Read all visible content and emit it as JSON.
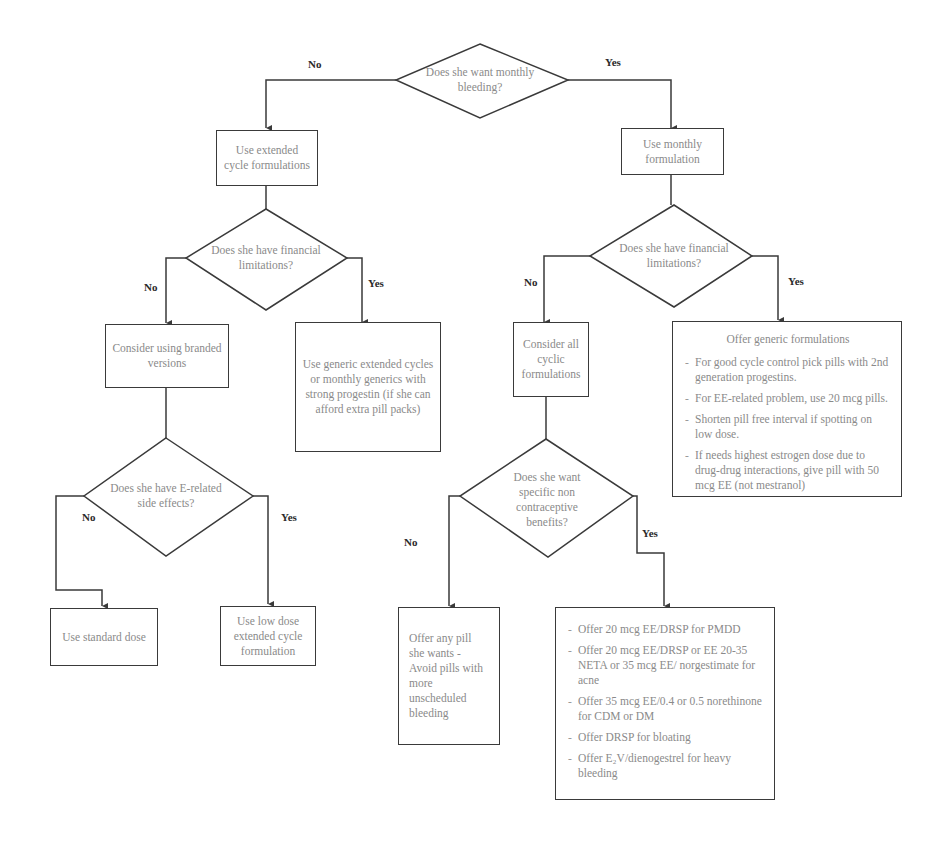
{
  "diagram": {
    "type": "flowchart",
    "colors": {
      "line": "#3a3a3a",
      "node_text": "#8a8a8a",
      "edge_label": "#2a2a2a",
      "background": "#ffffff"
    },
    "decisions": {
      "d1": "Does she want monthly bleeding?",
      "d2": "Does she have financial limitations?",
      "d3": "Does she have financial limitations?",
      "d4": "Does she have E-related side effects?",
      "d5": "Does she want specific non contraceptive benefits?"
    },
    "actions": {
      "extended": "Use extended cycle formulations",
      "monthly": "Use monthly formulation",
      "branded": "Consider using branded versions",
      "generic_extended": "Use generic extended cycles or monthly generics with strong progestin (if she can afford extra pill packs)",
      "cyclic": "Consider all cyclic formulations",
      "standard_dose": "Use standard dose",
      "low_dose": "Use low dose extended cycle formulation",
      "any_pill": "Offer any pill she wants - Avoid pills with more unscheduled bleeding"
    },
    "generic_formulations": {
      "title": "Offer generic formulations",
      "items": [
        "For good cycle control pick pills with 2nd generation progestins.",
        "For EE-related problem, use 20 mcg pills.",
        "Shorten pill free interval if spotting on low dose.",
        "If needs highest estrogen dose due to drug-drug interactions, give pill with 50 mcg EE (not mestranol)"
      ]
    },
    "non_contraceptive_benefits": {
      "items": [
        "Offer 20 mcg EE/DRSP for PMDD",
        "Offer 20 mcg EE/DRSP or EE 20-35 NETA or 35 mcg EE/ norgestimate for acne",
        "Offer 35 mcg EE/0.4 or 0.5 norethinone for CDM or DM",
        "Offer DRSP for bloating",
        "Offer E₂V/dienogestrel for heavy bleeding"
      ]
    },
    "edge_labels": {
      "d1_no": "No",
      "d1_yes": "Yes",
      "d2_no": "No",
      "d2_yes": "Yes",
      "d3_no": "No",
      "d3_yes": "Yes",
      "d4_no": "No",
      "d4_yes": "Yes",
      "d5_no": "No",
      "d5_yes": "Yes"
    }
  }
}
